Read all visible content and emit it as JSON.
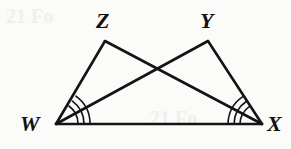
{
  "figure": {
    "kind": "geometry-diagram",
    "background_color": "#fbfbf9",
    "stroke_color": "#141414",
    "canvas": {
      "width": 291,
      "height": 149
    },
    "vertices": [
      {
        "id": "W",
        "label": "W",
        "x": 56,
        "y": 124,
        "label_x": 20,
        "label_y": 113
      },
      {
        "id": "X",
        "label": "X",
        "x": 262,
        "y": 124,
        "label_x": 267,
        "label_y": 113
      },
      {
        "id": "Z",
        "label": "Z",
        "x": 105,
        "y": 41,
        "label_x": 96,
        "label_y": 10
      },
      {
        "id": "Y",
        "label": "Y",
        "x": 208,
        "y": 41,
        "label_x": 200,
        "label_y": 10
      }
    ],
    "segments": [
      {
        "name": "segment-WZ",
        "from": "W",
        "to": "Z"
      },
      {
        "name": "segment-ZX",
        "from": "Z",
        "to": "X"
      },
      {
        "name": "segment-WY",
        "from": "W",
        "to": "Y"
      },
      {
        "name": "segment-YX",
        "from": "Y",
        "to": "X"
      },
      {
        "name": "segment-WX",
        "from": "W",
        "to": "X"
      }
    ],
    "angle_marks": [
      {
        "name": "angle-mark-W",
        "vertex": "W",
        "between": [
          "Z",
          "X"
        ],
        "arcs": 3
      },
      {
        "name": "angle-mark-X",
        "vertex": "X",
        "between": [
          "Y",
          "W"
        ],
        "arcs": 3
      }
    ],
    "intersection": {
      "name": "diagonal-crossing",
      "x": 160,
      "y": 73
    },
    "bleed_text": "21 Fo"
  }
}
